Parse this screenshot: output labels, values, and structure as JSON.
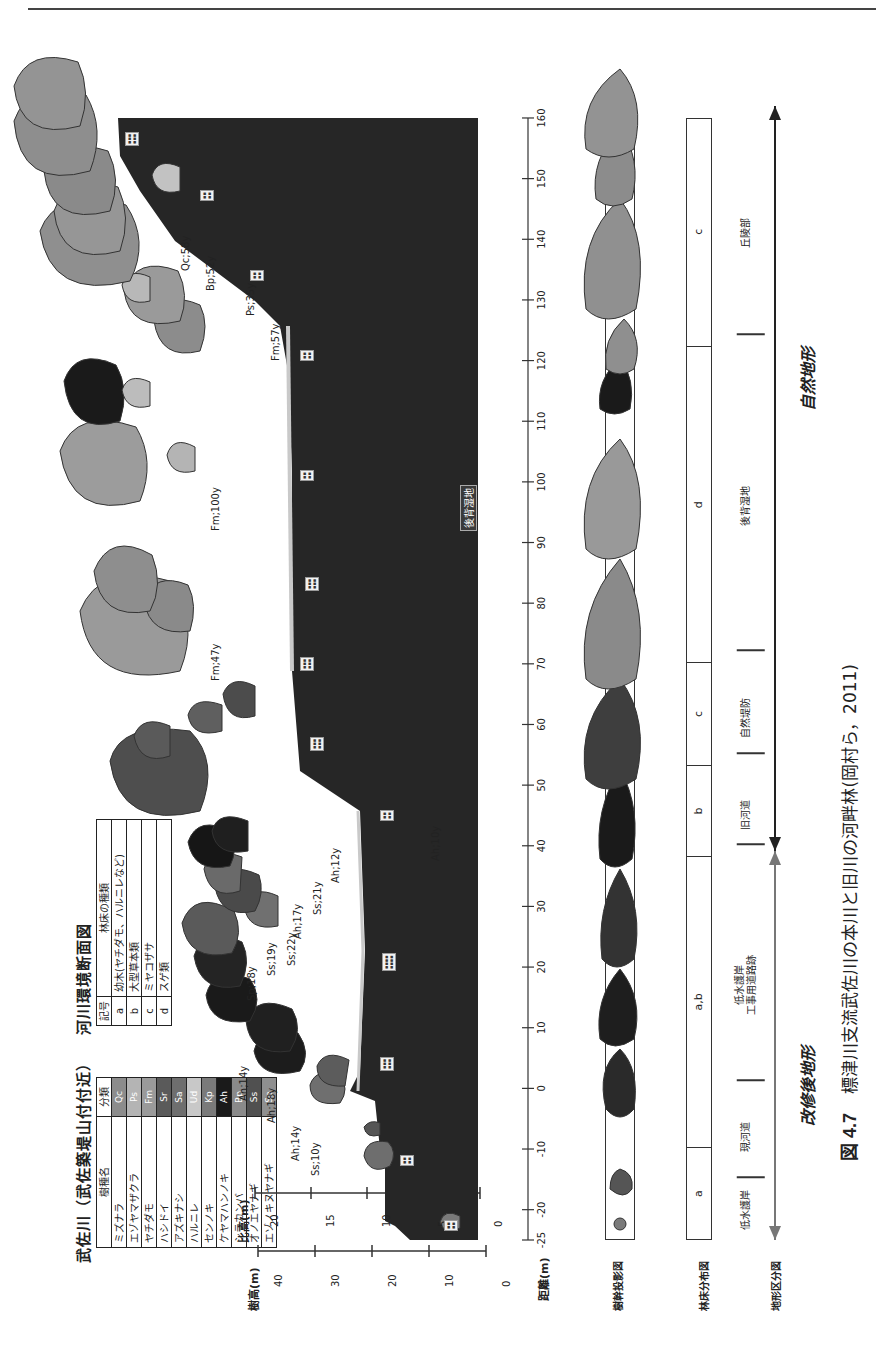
{
  "figure": {
    "title_left": "武佐川（武佐築堤山付付近）",
    "title_right": "河川環境断面図",
    "caption_number": "図 4.7",
    "caption_text": "標津川支流武佐川の本川と旧川の河畔林(岡村ら，2011)"
  },
  "species_legend": {
    "headers": [
      "樹種名",
      "分類"
    ],
    "rows": [
      {
        "name": "ミズナラ",
        "code": "Qc",
        "color": "#8c8c8c"
      },
      {
        "name": "エゾヤマザクラ",
        "code": "Ps",
        "color": "#b4b4b4"
      },
      {
        "name": "ヤチダモ",
        "code": "Fm",
        "color": "#9a9a9a"
      },
      {
        "name": "ハシドイ",
        "code": "Sr",
        "color": "#5a5a5a"
      },
      {
        "name": "アズキナシ",
        "code": "Sa",
        "color": "#6e6e6e"
      },
      {
        "name": "ハルニレ",
        "code": "Ud",
        "color": "#c8c8c8"
      },
      {
        "name": "センノキ",
        "code": "Kp",
        "color": "#7a7a7a"
      },
      {
        "name": "ケヤマハンノキ",
        "code": "Ah",
        "color": "#1a1a1a"
      },
      {
        "name": "シラカンバ",
        "code": "Bp",
        "color": "#8a8a8a"
      },
      {
        "name": "オノエヤナギ",
        "code": "Ss",
        "color": "#505050"
      },
      {
        "name": "エゾノキヌヤナギ",
        "code": "Sp",
        "color": "#8f8f8f"
      }
    ]
  },
  "floor_legend": {
    "headers": [
      "記号",
      "林床の種類"
    ],
    "rows": [
      {
        "code": "a",
        "desc": "幼木(ヤチダモ、ハルニレなど)"
      },
      {
        "code": "b",
        "desc": "大型草本類"
      },
      {
        "code": "c",
        "desc": "ミヤコザサ"
      },
      {
        "code": "d",
        "desc": "スゲ類"
      }
    ]
  },
  "axes": {
    "tree_height": {
      "label": "樹高(m)",
      "ticks": [
        "40",
        "30",
        "20",
        "10",
        "0"
      ]
    },
    "relative_height": {
      "label": "比高(m)",
      "ticks": [
        "20",
        "15",
        "10",
        "5",
        "0"
      ]
    },
    "distance": {
      "label": "距離(m)",
      "ticks": [
        "-25",
        "-20",
        "-10",
        "0",
        "10",
        "20",
        "30",
        "40",
        "50",
        "60",
        "70",
        "80",
        "90",
        "100",
        "110",
        "120",
        "130",
        "140",
        "150",
        "160"
      ]
    }
  },
  "row_labels": {
    "projection": "樹幹投影図",
    "floor_distribution": "林床分布図",
    "landform": "地形区分図"
  },
  "floor_distribution": [
    {
      "label": "a",
      "from": -25,
      "to": -10
    },
    {
      "label": "a,b",
      "from": -10,
      "to": 38
    },
    {
      "label": "b",
      "from": 38,
      "to": 53
    },
    {
      "label": "c",
      "from": 53,
      "to": 70
    },
    {
      "label": "d",
      "from": 70,
      "to": 122
    },
    {
      "label": "c",
      "from": 122,
      "to": 160
    }
  ],
  "landform_zones": [
    {
      "label": "低水護岸",
      "at": -20
    },
    {
      "label": "現河道",
      "at": -8
    },
    {
      "label": "低水護岸\n工事用道路跡",
      "at": 17
    },
    {
      "label": "旧河道",
      "at": 45
    },
    {
      "label": "自然堤防",
      "at": 61
    },
    {
      "label": "後背湿地",
      "at": 96
    },
    {
      "label": "丘陵部",
      "at": 141
    }
  ],
  "landform_arrows": {
    "modified": "改修後地形",
    "natural": "自然地形"
  },
  "tree_labels": [
    {
      "text": "Ss;10y"
    },
    {
      "text": "Ah;14y"
    },
    {
      "text": "Ah;18y"
    },
    {
      "text": "Ah;14y"
    },
    {
      "text": "Sp;18y"
    },
    {
      "text": "Ss;19y"
    },
    {
      "text": "Ss;22y"
    },
    {
      "text": "Ah;17y"
    },
    {
      "text": "Ss;21y"
    },
    {
      "text": "Ah;12y"
    },
    {
      "text": "Ah;10y"
    },
    {
      "text": "Fm;47y"
    },
    {
      "text": "Fm;100y"
    },
    {
      "text": "Fm;57y"
    },
    {
      "text": "Ps;35y"
    },
    {
      "text": "Bp;52y"
    },
    {
      "text": "Qc;58y"
    }
  ],
  "terrain_annotation": "後背湿地",
  "colors": {
    "terrain_dark": "#1e1e1e",
    "terrain_mid": "#3a3a3a",
    "water_surface": "#c9c9c9",
    "tree_default": "#8d8d8d",
    "axis": "#333333"
  }
}
